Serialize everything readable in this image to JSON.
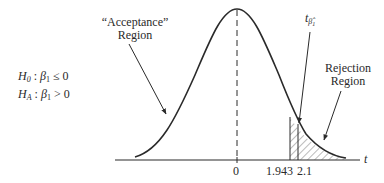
{
  "hypotheses": {
    "null": {
      "lhs": "H",
      "lhs_sub": "0",
      "param": "β",
      "param_sub": "1",
      "op": "≤",
      "value": "0"
    },
    "alt": {
      "lhs": "H",
      "lhs_sub": "A",
      "param": "β",
      "param_sub": "1",
      "op": ">",
      "value": "0"
    }
  },
  "labels": {
    "acceptance_line1": "“Acceptance”",
    "acceptance_line2": "Region",
    "rejection_line1": "Rejection",
    "rejection_line2": "Region",
    "t_stat": "t",
    "t_stat_sub": "β̂",
    "t_stat_subsub": "1",
    "axis_var": "t"
  },
  "ticks": {
    "zero": "0",
    "critical": "1.943",
    "observed": "2.1"
  },
  "colors": {
    "ink": "#2a2a2a",
    "background": "#ffffff"
  }
}
